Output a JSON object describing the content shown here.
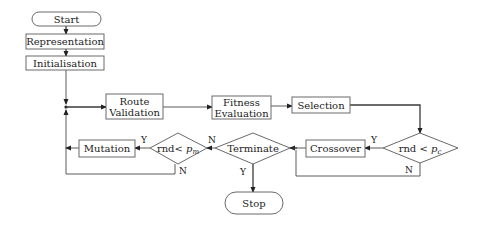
{
  "diagram": {
    "type": "flowchart",
    "nodes": {
      "start": {
        "label": "Start",
        "shape": "terminal"
      },
      "representation": {
        "label": "Representation",
        "shape": "process"
      },
      "initialisation": {
        "label": "Initialisation",
        "shape": "process"
      },
      "route_validation": {
        "line1": "Route",
        "line2": "Validation",
        "shape": "process"
      },
      "fitness_evaluation": {
        "line1": "Fitness",
        "line2": "Evaluation",
        "shape": "process"
      },
      "selection": {
        "label": "Selection",
        "shape": "process"
      },
      "crossover_decision": {
        "prefix": "rnd <",
        "var": "p",
        "sub": "c",
        "shape": "decision"
      },
      "crossover": {
        "label": "Crossover",
        "shape": "process"
      },
      "terminate": {
        "label": "Terminate",
        "shape": "decision"
      },
      "mutation_decision": {
        "prefix": "rnd<",
        "var": "p",
        "sub": "m",
        "shape": "decision"
      },
      "mutation": {
        "label": "Mutation",
        "shape": "process"
      },
      "stop": {
        "label": "Stop",
        "shape": "terminal"
      }
    },
    "edge_labels": {
      "crossover_yes": "Y",
      "crossover_no": "N",
      "terminate_yes": "Y",
      "terminate_no": "N",
      "mutation_yes": "Y",
      "mutation_no": "N"
    },
    "edges": [
      [
        "start",
        "representation"
      ],
      [
        "representation",
        "initialisation"
      ],
      [
        "initialisation",
        "route_validation"
      ],
      [
        "route_validation",
        "fitness_evaluation"
      ],
      [
        "fitness_evaluation",
        "selection"
      ],
      [
        "selection",
        "crossover_decision"
      ],
      [
        "crossover_decision",
        "crossover",
        "Y"
      ],
      [
        "crossover_decision",
        "terminate",
        "N"
      ],
      [
        "crossover",
        "terminate"
      ],
      [
        "terminate",
        "stop",
        "Y"
      ],
      [
        "terminate",
        "mutation_decision",
        "N"
      ],
      [
        "mutation_decision",
        "mutation",
        "Y"
      ],
      [
        "mutation_decision",
        "route_validation",
        "N"
      ],
      [
        "mutation",
        "route_validation"
      ]
    ]
  }
}
